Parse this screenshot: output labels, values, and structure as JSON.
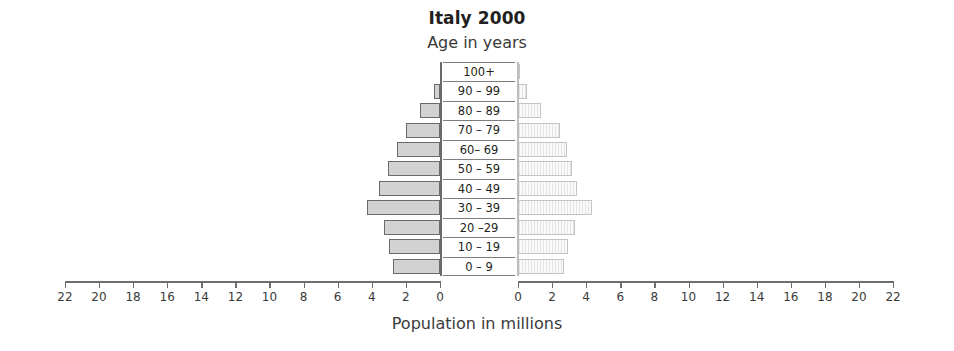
{
  "chart_data": {
    "type": "bar",
    "subtype": "population-pyramid",
    "title": "Italy 2000",
    "subtitle": "Age in years",
    "xlabel": "Population in millions",
    "ylabel": "Age in years",
    "grid": false,
    "legend": false,
    "axis_note": "Mirrored dual axes: left axis decreases 22 to 0 (left to right), right axis increases 0 to 22",
    "xlim": [
      0,
      22
    ],
    "xticks": [
      0,
      2,
      4,
      6,
      8,
      10,
      12,
      14,
      16,
      18,
      20,
      22
    ],
    "left_axis_ticklabels": [
      "22",
      "20",
      "18",
      "16",
      "14",
      "12",
      "10",
      "8",
      "6",
      "4",
      "2",
      "0"
    ],
    "right_axis_ticklabels": [
      "0",
      "2",
      "4",
      "6",
      "8",
      "10",
      "12",
      "14",
      "16",
      "18",
      "20",
      "22"
    ],
    "categories": [
      "100+",
      "90 – 99",
      "80 – 89",
      "70 – 79",
      "60– 69",
      "50 – 59",
      "40 – 49",
      "30 – 39",
      "20 –29",
      "10 – 19",
      "0 – 9"
    ],
    "series": [
      {
        "name": "left",
        "side": "left",
        "color": "#d2d2d2",
        "edge_color": "#6a6a6a",
        "values": [
          0.0,
          0.35,
          1.15,
          2.0,
          2.5,
          3.05,
          3.55,
          4.3,
          3.3,
          3.0,
          2.75
        ]
      },
      {
        "name": "right",
        "side": "right",
        "color": "#f2f2f2",
        "edge_color": "#c4c4c4",
        "hatch": "vertical-stripes",
        "values": [
          0.05,
          0.55,
          1.35,
          2.45,
          2.85,
          3.15,
          3.45,
          4.35,
          3.35,
          2.95,
          2.7
        ]
      }
    ]
  }
}
